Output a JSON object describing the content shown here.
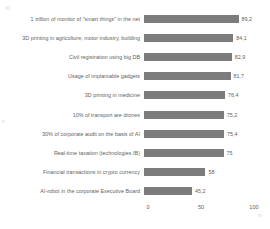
{
  "chart_data": {
    "type": "bar",
    "orientation": "horizontal",
    "title": "",
    "subtitle": "",
    "xlabel": "",
    "ylabel": "",
    "xlim": [
      0,
      100
    ],
    "grid": false,
    "legend": null,
    "bar_color": "#7c7c7c",
    "decimal_separator": ",",
    "xticks": [
      "0",
      "50",
      "100"
    ],
    "xtick_values": [
      0,
      50,
      100
    ],
    "categories": [
      "1 trillion of monitor of \"smart things\" in the net",
      "3D printing in agriculture, motor industry, building",
      "Civil registration using big DB",
      "Usage of implantable gadgets",
      "3D printing in medicine",
      "10% of transport are drones",
      "30% of corporate audit on the basis of AI",
      "Real-time taxation (technologies IB)",
      "Financial transactions in crypto currency",
      "AI-robot in the corporate Executive Board"
    ],
    "values": [
      89.2,
      84.1,
      82.9,
      81.7,
      76.4,
      75.2,
      75.4,
      75,
      58,
      45.2
    ],
    "value_labels": [
      "89,2",
      "84,1",
      "82,9",
      "81,7",
      "76,4",
      "75,2",
      "75,4",
      "75",
      "58",
      "45,2"
    ]
  }
}
